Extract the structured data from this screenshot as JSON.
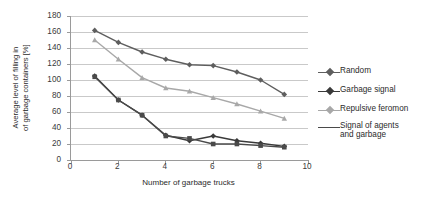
{
  "chart_data": {
    "type": "line",
    "title": "",
    "xlabel": "Number of garbage trucks",
    "ylabel": "Average level of filling in of garbage containers [%]",
    "ylabel_lines": [
      "Average level of filling in",
      "of garbage containers [%]"
    ],
    "x": [
      1,
      2,
      3,
      4,
      5,
      6,
      7,
      8,
      9
    ],
    "xlim": [
      0,
      10
    ],
    "ylim": [
      0,
      180
    ],
    "xticks": [
      0,
      2,
      4,
      6,
      8,
      10
    ],
    "yticks": [
      0,
      20,
      40,
      60,
      80,
      100,
      120,
      140,
      160,
      180
    ],
    "grid": "horizontal",
    "legend_position": "right",
    "series": [
      {
        "name": "Random",
        "color": "#5e5e5e",
        "marker": "diamond",
        "values": [
          162,
          147,
          135,
          126,
          119,
          118,
          110,
          100,
          82
        ]
      },
      {
        "name": "Garbage signal",
        "color": "#3a3a3a",
        "marker": "diamond",
        "values": [
          105,
          75,
          56,
          31,
          24,
          30,
          24,
          21,
          17
        ]
      },
      {
        "name": "Repulsive feromon",
        "color": "#a8a8a8",
        "marker": "triangle",
        "values": [
          150,
          126,
          103,
          90,
          86,
          78,
          70,
          61,
          52
        ]
      },
      {
        "name": "Signal of agents and garbage",
        "color": "#4a4a4a",
        "marker": "square",
        "values": [
          104,
          75,
          56,
          30,
          27,
          20,
          20,
          18,
          16
        ]
      }
    ]
  },
  "legend": {
    "entries": [
      {
        "label": "Random"
      },
      {
        "label": "Garbage signal"
      },
      {
        "label": "Repulsive feromon"
      },
      {
        "label": "Signal of agents\nand garbage"
      }
    ]
  },
  "axes": {
    "y_tick_labels": [
      "180",
      "160",
      "140",
      "120",
      "100",
      "80",
      "60",
      "40",
      "20",
      "0"
    ],
    "x_tick_labels": [
      "0",
      "2",
      "4",
      "6",
      "8",
      "10"
    ]
  }
}
